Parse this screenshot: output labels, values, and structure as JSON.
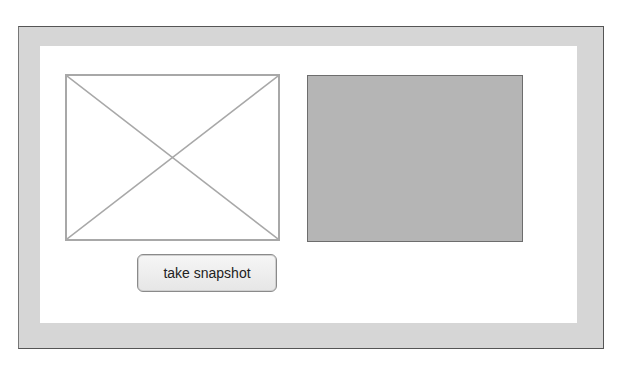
{
  "page": {
    "video_placeholder": {
      "icon": "broken-image-x-icon"
    },
    "canvas": {
      "fill_color": "#b5b5b5"
    },
    "snapshot_button": {
      "label": "take snapshot"
    }
  }
}
